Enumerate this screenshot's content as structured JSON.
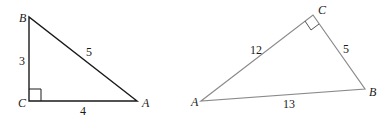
{
  "triangle_left": {
    "vertices": {
      "B": "B",
      "C": "C",
      "A": "A"
    },
    "sides": {
      "BC": "3",
      "CA": "4",
      "AB": "5"
    },
    "right_angle_at": "C",
    "stroke_color": "#1a1a1a"
  },
  "triangle_right": {
    "vertices": {
      "C": "C",
      "A": "A",
      "B": "B"
    },
    "sides": {
      "AC": "12",
      "CB": "5",
      "AB": "13"
    },
    "right_angle_at": "C",
    "stroke_color": "#8a8a8a"
  }
}
